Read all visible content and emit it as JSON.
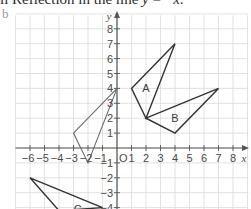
{
  "heading": {
    "prefix": "ii Reflection in the line ",
    "var_y": "y",
    "equals": " = −",
    "var_x": "x",
    "suffix": "."
  },
  "part_label": "b",
  "axes": {
    "x_label": "x",
    "y_label": "y",
    "origin_label": "O",
    "x_ticks": [
      -6,
      -5,
      -4,
      -3,
      -2,
      -1,
      1,
      2,
      3,
      4,
      5,
      6,
      7,
      8
    ],
    "y_ticks": [
      -4,
      -3,
      -2,
      -1,
      1,
      2,
      3,
      4,
      5,
      6,
      7,
      8
    ],
    "x_range": [
      -7,
      9
    ],
    "y_range": [
      -4,
      9
    ]
  },
  "colors": {
    "original": "#333333",
    "image": "#6a6a6a",
    "grid": "#d9d9d9",
    "axis": "#555555"
  },
  "shapes": [
    {
      "name": "A",
      "label": "A",
      "vertices": [
        [
          1,
          4
        ],
        [
          4,
          7
        ],
        [
          2,
          2
        ]
      ],
      "label_pos": [
        2,
        4
      ],
      "style": "original"
    },
    {
      "name": "B",
      "label": "B",
      "vertices": [
        [
          2,
          2
        ],
        [
          7,
          4
        ],
        [
          4,
          1
        ]
      ],
      "label_pos": [
        4,
        2
      ],
      "style": "original"
    },
    {
      "name": "reflected-A",
      "label": "",
      "vertices": [
        [
          -3,
          1
        ],
        [
          0,
          4
        ],
        [
          -2,
          -1
        ]
      ],
      "label_pos": null,
      "style": "image"
    },
    {
      "name": "C",
      "label": "C",
      "vertices": [
        [
          -6,
          -2
        ],
        [
          -1,
          -4
        ],
        [
          -4,
          -4.2
        ]
      ],
      "label_pos": [
        -2.7,
        -4.1
      ],
      "style": "original"
    }
  ]
}
